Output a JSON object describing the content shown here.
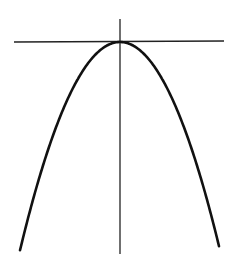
{
  "diagram": {
    "type": "parabola-with-axes",
    "colors": {
      "background": "#ffffff",
      "curve": "#111111",
      "axes": "#222222"
    },
    "horizontal_axis": {
      "x1": 14,
      "y1": 42,
      "x2": 224,
      "y2": 41
    },
    "vertical_axis": {
      "x1": 120,
      "y1": 19,
      "x2": 120,
      "y2": 254
    },
    "parabola": {
      "vertex": [
        120,
        42
      ],
      "left_end": [
        20,
        248
      ],
      "right_end": [
        219,
        247
      ],
      "equation": "y = 42 + (x - 120)^2 / 48"
    }
  }
}
